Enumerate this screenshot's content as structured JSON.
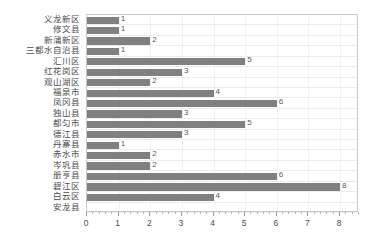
{
  "chart_data": {
    "type": "bar",
    "orientation": "horizontal",
    "title": "",
    "subtitle": "",
    "xlabel": "",
    "ylabel": "",
    "xlim": [
      0,
      8.6
    ],
    "ylim": null,
    "grid": true,
    "legend": null,
    "legend_position": "none",
    "bar_color": "#808080",
    "axis_color": "#c8c8c8",
    "grid_color": "#ececec",
    "text_color": "#4d4d4d",
    "x_ticks": [
      0,
      1,
      2,
      3,
      4,
      5,
      6,
      7,
      8
    ],
    "x_tick_labels": [
      "0",
      "1",
      "2",
      "3",
      "4",
      "5",
      "6",
      "7",
      "8"
    ],
    "minor_ticks_per_interval": 5,
    "categories": [
      "义龙新区",
      "修文县",
      "新蒲新区",
      "三都水自治县",
      "汇川区",
      "红花岗区",
      "观山湖区",
      "福泉市",
      "凤冈县",
      "独山县",
      "都匀市",
      "德江县",
      "丹寨县",
      "赤水市",
      "岑巩县",
      "册亨县",
      "碧江区",
      "白云区",
      "安龙县"
    ],
    "values": [
      1,
      1,
      2,
      1,
      5,
      3,
      2,
      4,
      6,
      3,
      5,
      3,
      1,
      2,
      2,
      6,
      8,
      4,
      0
    ],
    "data_labels": [
      "1",
      "1",
      "2",
      "1",
      "5",
      "3",
      "2",
      "4",
      "6",
      "3",
      "5",
      "3",
      "1",
      "2",
      "2",
      "6",
      "8",
      "4",
      ""
    ]
  }
}
